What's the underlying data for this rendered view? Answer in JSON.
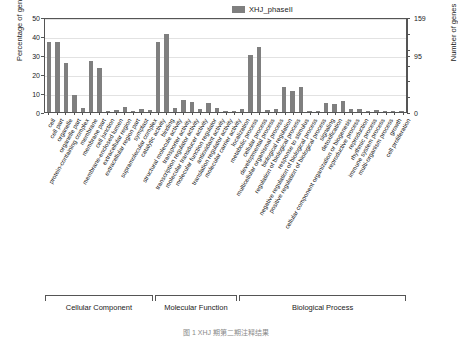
{
  "chart_data": {
    "type": "bar",
    "title": "",
    "xlabel": "",
    "ylabel": "Percentage of genes",
    "ylabel_right": "Number of genes",
    "ylim": [
      0,
      50
    ],
    "yticks": [
      0,
      10,
      20,
      30,
      40,
      50
    ],
    "ylim_right": [
      0,
      159
    ],
    "yticks_right": [
      0,
      95,
      159
    ],
    "grid": true,
    "legend": [
      {
        "name": "XHJ_phaseII",
        "color": "#7f7f7f"
      }
    ],
    "legend_position": "top-right",
    "bar_color": "#7f7f7f",
    "categories": [
      "cell",
      "cell part",
      "organelle",
      "organelle part",
      "protein-containing complex",
      "membrane",
      "membrane part",
      "cell junction",
      "membrane-enclosed lumen",
      "extracellular region",
      "extracellular region part",
      "symplast",
      "supramolecular complex",
      "catalytic activity",
      "binding",
      "structural molecule activity",
      "transporter activity",
      "transcription regulator activity",
      "molecular transducer activity",
      "molecular function regulator",
      "antioxidant activity",
      "translation regulator activity",
      "molecular carrier activity",
      "localization",
      "metabolic process",
      "cellular process",
      "developmental process",
      "multicellular organismal process",
      "biological regulation",
      "regulation of biological process",
      "response to stimulus",
      "negative regulation of biological process",
      "positive regulation of biological process",
      "signaling",
      "detoxification",
      "cellular component organization or biogenesis",
      "reproductive process",
      "reproduction",
      "rhythmic process",
      "immune system process",
      "multi-organism process",
      "growth",
      "cell proliferation"
    ],
    "series": [
      {
        "name": "XHJ_phaseII",
        "values": [
          37,
          37,
          26,
          9,
          2,
          27,
          23,
          0.6,
          1.2,
          2.5,
          0.6,
          1.6,
          1.0,
          37,
          41,
          2.2,
          6.5,
          5.5,
          1.4,
          4.5,
          2.0,
          0.6,
          0.6,
          1.4,
          30,
          34,
          1.0,
          1.6,
          13,
          11,
          13,
          0.6,
          0.6,
          5.0,
          4.2,
          6.0,
          1.8,
          1.8,
          0.5,
          1.0,
          0.6,
          0.6,
          0.5
        ]
      }
    ],
    "groups": [
      {
        "label": "Cellular Component",
        "start": 0,
        "end": 12
      },
      {
        "label": "Molecular Function",
        "start": 13,
        "end": 22
      },
      {
        "label": "Biological Process",
        "start": 23,
        "end": 42
      }
    ]
  },
  "caption": {
    "text": "图 1  XHJ 期第二期注释结果"
  }
}
